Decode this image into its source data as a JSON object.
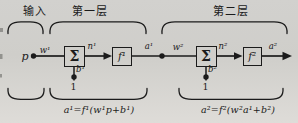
{
  "colors": {
    "background": "#d1d0cd",
    "ink": "#1b1b1b"
  },
  "sections": {
    "input_label": "输入",
    "layer1_label": "第一层",
    "layer2_label": "第二层"
  },
  "diagram": {
    "input": {
      "symbol": "p"
    },
    "layer1": {
      "weight": "w¹",
      "sum": "Σ",
      "net": "n¹",
      "transfer": "f¹",
      "output": "a¹",
      "bias": "b¹",
      "bias_input": "1",
      "formula": "a¹=f¹(w¹p+b¹)"
    },
    "layer2": {
      "weight": "w²",
      "sum": "Σ",
      "net": "n²",
      "transfer": "f²",
      "output": "a²",
      "bias": "b²",
      "bias_input": "1",
      "formula": "a²=f²(w²a¹+b²)"
    }
  }
}
